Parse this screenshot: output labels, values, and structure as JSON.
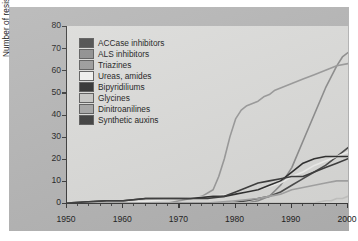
{
  "figure": {
    "background_color": "#b5b5b5",
    "plot_background_color": "#dcdcda",
    "axis_color": "#3a3a3a"
  },
  "chart_data": {
    "type": "line",
    "title": "",
    "xlabel": "",
    "ylabel": "Number of resistant species",
    "xlim": [
      1950,
      2000
    ],
    "ylim": [
      0,
      80
    ],
    "xticks": [
      1950,
      1960,
      1970,
      1980,
      1990,
      2000
    ],
    "yticks": [
      0,
      10,
      20,
      30,
      40,
      50,
      60,
      70,
      80
    ],
    "xtick_labels": [
      "1950",
      "1960",
      "1970",
      "1980",
      "1990",
      "2000"
    ],
    "ytick_labels": [
      "0",
      "10",
      "20",
      "30",
      "40",
      "50",
      "60",
      "70",
      "80"
    ],
    "minor_tick_interval": 2,
    "grid": false,
    "legend_position": "upper left",
    "series": [
      {
        "name": "ACCase inhibitors",
        "color": "#4a4a4a",
        "x": [
          1950,
          1975,
          1979,
          1982,
          1984,
          1986,
          1988,
          1990,
          1992,
          1994,
          1996,
          1998,
          2000
        ],
        "values": [
          0,
          0,
          0,
          1,
          2,
          3,
          5,
          8,
          11,
          14,
          17,
          21,
          25
        ]
      },
      {
        "name": "ALS inhibitors",
        "color": "#8d8d8d",
        "x": [
          1950,
          1982,
          1984,
          1986,
          1988,
          1990,
          1992,
          1994,
          1996,
          1998,
          1999,
          2000
        ],
        "values": [
          0,
          0,
          1,
          3,
          8,
          16,
          28,
          40,
          52,
          62,
          66,
          68
        ]
      },
      {
        "name": "Triazines",
        "color": "#9a9a9a",
        "x": [
          1950,
          1968,
          1970,
          1972,
          1974,
          1976,
          1977,
          1978,
          1979,
          1980,
          1981,
          1982,
          1983,
          1984,
          1985,
          1986,
          1987,
          1988,
          1990,
          1992,
          1994,
          1996,
          1998,
          2000
        ],
        "values": [
          0,
          0,
          1,
          2,
          3,
          6,
          12,
          20,
          30,
          38,
          42,
          44,
          45,
          46,
          48,
          49,
          51,
          52,
          54,
          56,
          58,
          60,
          62,
          63
        ]
      },
      {
        "name": "Ureas, amides",
        "color": "#f2f2f0",
        "x": [
          1950,
          1960,
          1965,
          1970,
          1975,
          1980,
          1984,
          1988,
          1990,
          1992,
          1994,
          1996,
          1998,
          2000
        ],
        "values": [
          0,
          0,
          1,
          2,
          3,
          4,
          6,
          9,
          12,
          14,
          17,
          19,
          21,
          23
        ]
      },
      {
        "name": "Bipyridiliums",
        "color": "#2e2e2e",
        "x": [
          1950,
          1957,
          1960,
          1964,
          1968,
          1972,
          1976,
          1978,
          1980,
          1982,
          1984,
          1986,
          1988,
          1990,
          1992,
          1994,
          1996,
          1998,
          2000
        ],
        "values": [
          0,
          1,
          1,
          2,
          2,
          2,
          3,
          3,
          4,
          5,
          6,
          8,
          10,
          14,
          18,
          20,
          21,
          21,
          21
        ]
      },
      {
        "name": "Glycines",
        "color": "#c7c7c5",
        "x": [
          1950,
          1980,
          1990,
          1994,
          1996,
          1997,
          1998,
          1999,
          2000
        ],
        "values": [
          0,
          0,
          0,
          0,
          1,
          1,
          2,
          2,
          3
        ]
      },
      {
        "name": "Dinitroanilines",
        "color": "#a5a5a5",
        "x": [
          1950,
          1975,
          1980,
          1984,
          1986,
          1988,
          1990,
          1992,
          1994,
          1996,
          1998,
          2000
        ],
        "values": [
          0,
          0,
          1,
          2,
          3,
          4,
          6,
          7,
          8,
          9,
          10,
          10
        ]
      },
      {
        "name": "Synthetic auxins",
        "color": "#3c3c3c",
        "x": [
          1950,
          1957,
          1960,
          1964,
          1970,
          1975,
          1978,
          1980,
          1982,
          1984,
          1986,
          1988,
          1990,
          1992,
          1994,
          1996,
          1998,
          2000
        ],
        "values": [
          0,
          1,
          1,
          2,
          2,
          2,
          3,
          5,
          7,
          9,
          10,
          11,
          12,
          12,
          14,
          16,
          18,
          20
        ]
      }
    ]
  },
  "legend": {
    "items": [
      {
        "label": "ACCase inhibitors",
        "color": "#4a4a4a"
      },
      {
        "label": "ALS inhibitors",
        "color": "#8d8d8d"
      },
      {
        "label": "Triazines",
        "color": "#9a9a9a"
      },
      {
        "label": "Ureas, amides",
        "color": "#f2f2f0"
      },
      {
        "label": "Bipyridiliums",
        "color": "#2e2e2e"
      },
      {
        "label": "Glycines",
        "color": "#c7c7c5"
      },
      {
        "label": "Dinitroanilines",
        "color": "#a5a5a5"
      },
      {
        "label": "Synthetic auxins",
        "color": "#3c3c3c"
      }
    ]
  }
}
